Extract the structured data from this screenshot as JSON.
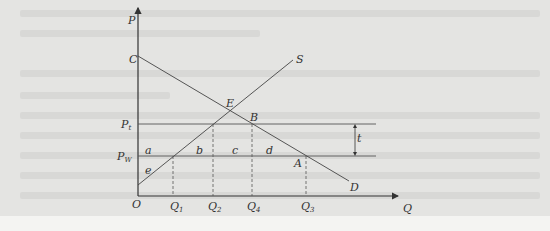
{
  "diagram": {
    "type": "supply-demand-tariff",
    "axes": {
      "y_label": "P",
      "x_label": "Q",
      "origin_label": "O"
    },
    "curves": [
      {
        "name": "demand",
        "label": "D",
        "start_label": "C"
      },
      {
        "name": "supply",
        "label": "S"
      }
    ],
    "price_lines": [
      {
        "name": "tariff-price",
        "label": "P",
        "subscript": "t"
      },
      {
        "name": "world-price",
        "label": "P",
        "subscript": "W"
      }
    ],
    "points": {
      "equilibrium": "E",
      "B": "B",
      "A": "A",
      "C": "C"
    },
    "areas": [
      "a",
      "b",
      "c",
      "d",
      "e"
    ],
    "tariff_label": "t",
    "quantities": [
      {
        "label": "Q",
        "subscript": "1"
      },
      {
        "label": "Q",
        "subscript": "2"
      },
      {
        "label": "Q",
        "subscript": "4"
      },
      {
        "label": "Q",
        "subscript": "3"
      }
    ]
  }
}
